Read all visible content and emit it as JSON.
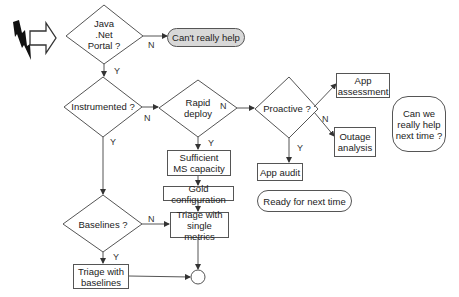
{
  "diagram": {
    "type": "flowchart",
    "start_icons": [
      "lightning-bolt",
      "hollow-right-arrow"
    ],
    "decisions": {
      "java_net_portal": "Java\n.Net\nPortal ?",
      "instrumented": "Instrumented ?",
      "rapid_deploy": "Rapid\ndeploy",
      "proactive": "Proactive ?",
      "baselines": "Baselines ?"
    },
    "processes": {
      "sufficient_ms_capacity": "Sufficient\nMS capacity",
      "gold_configuration": "Gold configuration",
      "triage_single_metrics": "Triage with\nsingle metrics",
      "triage_baselines": "Triage with\nbaselines",
      "app_audit": "App audit",
      "app_assessment": "App\nassessment",
      "outage_analysis": "Outage\nanalysis"
    },
    "terminals": {
      "cant_help": "Can't really help",
      "ready_next_time": "Ready for next time",
      "can_we_help": "Can we\nreally help\nnext time ?"
    },
    "edge_labels": {
      "yes": "Y",
      "no": "N"
    },
    "colors": {
      "line": "#555555",
      "terminal_fill_gray": "#d8d8d8",
      "background": "#ffffff"
    }
  }
}
